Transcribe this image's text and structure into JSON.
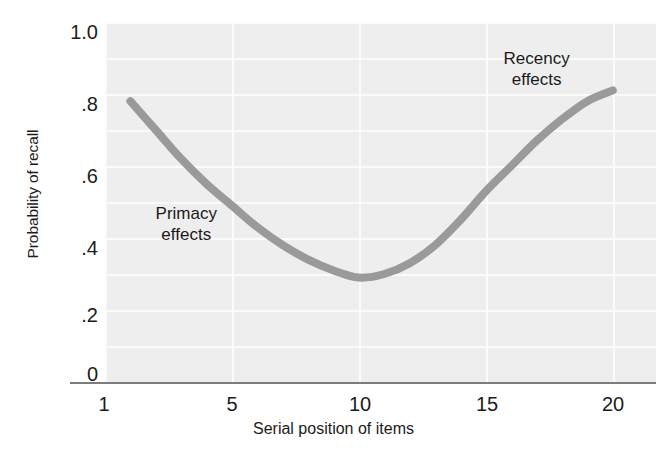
{
  "chart_data": {
    "type": "line",
    "title": "",
    "xlabel": "Serial position of items",
    "ylabel": "Probability of recall",
    "xlim": [
      0,
      21.7
    ],
    "ylim": [
      0,
      1.0
    ],
    "xticks": [
      1,
      5,
      10,
      15,
      20
    ],
    "xtick_labels": [
      "1",
      "5",
      "10",
      "15",
      "20"
    ],
    "yticks": [
      0,
      0.2,
      0.4,
      0.6,
      0.8,
      1.0
    ],
    "ytick_labels": [
      "0",
      ".2",
      ".4",
      ".6",
      ".8",
      "1.0"
    ],
    "grid": true,
    "legend": "none",
    "series": [
      {
        "name": "Probability of recall",
        "x": [
          1,
          2,
          3,
          4,
          5,
          6,
          7,
          8,
          9,
          10,
          11,
          12,
          13,
          14,
          15,
          16,
          17,
          18,
          19,
          20
        ],
        "values": [
          0.78,
          0.7,
          0.62,
          0.55,
          0.49,
          0.43,
          0.38,
          0.34,
          0.31,
          0.29,
          0.3,
          0.33,
          0.38,
          0.45,
          0.53,
          0.6,
          0.67,
          0.73,
          0.78,
          0.81
        ],
        "color": "#9a9a9a"
      }
    ],
    "annotations": [
      {
        "name": "primacy",
        "line1": "Primacy",
        "line2": "effects",
        "x": 3.2,
        "y": 0.44
      },
      {
        "name": "recency",
        "line1": "Recency",
        "line2": "effects",
        "x": 17.0,
        "y": 0.87
      }
    ],
    "style": {
      "panel_background": "#eeeeee",
      "gridline_color": "#fbfbfb",
      "axis_color": "#7d7d7d",
      "text_color": "#1b1b1b"
    }
  }
}
